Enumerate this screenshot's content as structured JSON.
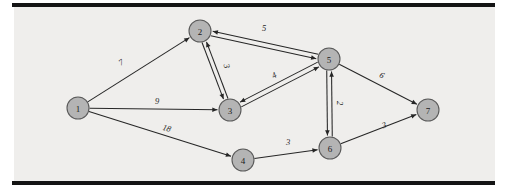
{
  "figure": {
    "title": "",
    "background_color": "#efeeec",
    "frame_color": "#141414",
    "node_fill": "#b4b4b4",
    "node_stroke": "#5a5a5a",
    "edge_color": "#262626"
  },
  "chart_data": {
    "type": "diagram",
    "graph_type": "weighted directed graph",
    "title": "",
    "xlabel": "",
    "ylabel": "",
    "node_count": 7,
    "edge_count": 14,
    "nodes": [
      {
        "id": "1",
        "label": "1",
        "x": 78,
        "y": 108
      },
      {
        "id": "2",
        "label": "2",
        "x": 200,
        "y": 31
      },
      {
        "id": "3",
        "label": "3",
        "x": 230,
        "y": 110
      },
      {
        "id": "4",
        "label": "4",
        "x": 243,
        "y": 160
      },
      {
        "id": "5",
        "label": "5",
        "x": 329,
        "y": 59
      },
      {
        "id": "6",
        "label": "6",
        "x": 330,
        "y": 148
      },
      {
        "id": "7",
        "label": "7",
        "x": 428,
        "y": 110
      }
    ],
    "edges": [
      {
        "from": "1",
        "to": "2",
        "weight": "7",
        "label_x": 121,
        "label_y": 62,
        "label_rotate": -32,
        "offset": 0
      },
      {
        "from": "1",
        "to": "3",
        "weight": "9",
        "label_x": 157,
        "label_y": 101,
        "label_rotate": 0,
        "offset": 0
      },
      {
        "from": "1",
        "to": "4",
        "weight": "18",
        "label_x": 167,
        "label_y": 128,
        "label_rotate": 17,
        "offset": 0
      },
      {
        "from": "2",
        "to": "3",
        "weight": "3",
        "label_x": 227,
        "label_y": 66,
        "label_rotate": 75,
        "offset": 2.2
      },
      {
        "from": "3",
        "to": "2",
        "weight": "",
        "label_x": 0,
        "label_y": 0,
        "label_rotate": 0,
        "offset": 2.2
      },
      {
        "from": "2",
        "to": "5",
        "weight": "",
        "label_x": 0,
        "label_y": 0,
        "label_rotate": 0,
        "offset": 2.4
      },
      {
        "from": "5",
        "to": "2",
        "weight": "5",
        "label_x": 264,
        "label_y": 28,
        "label_rotate": 0,
        "offset": 2.4
      },
      {
        "from": "3",
        "to": "5",
        "weight": "4",
        "label_x": 274,
        "label_y": 75,
        "label_rotate": -28,
        "offset": 2.4
      },
      {
        "from": "5",
        "to": "3",
        "weight": "",
        "label_x": 0,
        "label_y": 0,
        "label_rotate": 0,
        "offset": 2.4
      },
      {
        "from": "5",
        "to": "6",
        "weight": "2",
        "label_x": 340,
        "label_y": 103,
        "label_rotate": 90,
        "offset": 2.4
      },
      {
        "from": "6",
        "to": "5",
        "weight": "",
        "label_x": 0,
        "label_y": 0,
        "label_rotate": 0,
        "offset": 2.4
      },
      {
        "from": "4",
        "to": "6",
        "weight": "3",
        "label_x": 288,
        "label_y": 142,
        "label_rotate": 0,
        "offset": 0
      },
      {
        "from": "5",
        "to": "7",
        "weight": "6",
        "label_x": 382,
        "label_y": 75,
        "label_rotate": 27,
        "offset": 0
      },
      {
        "from": "6",
        "to": "7",
        "weight": "3",
        "label_x": 384,
        "label_y": 125,
        "label_rotate": -19,
        "offset": 0
      }
    ],
    "node_radius": 11,
    "legend": [],
    "annotations": []
  },
  "frame": {
    "top_bar": {
      "x": 12,
      "y": 3,
      "width": 483,
      "height": 4
    },
    "bottom_bar": {
      "x": 12,
      "y": 181,
      "width": 483,
      "height": 4
    },
    "plot": {
      "x": 14,
      "y": 7,
      "width": 481,
      "height": 174
    }
  }
}
